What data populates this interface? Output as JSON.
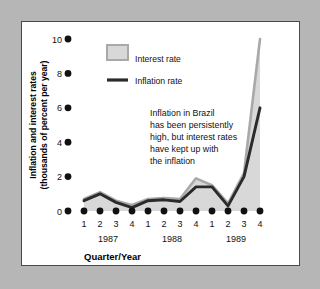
{
  "figure": {
    "background_color": "#b6b6b6",
    "panel_color": "#ffffff",
    "border_color": "#4a4a4a"
  },
  "chart_data": {
    "type": "area",
    "title": "",
    "subtitle": "",
    "xlabel": "Quarter/Year",
    "ylabel": "Inflation and interest rates (thousands of percent per year)",
    "ylabel_line1": "Inflation and interest rates",
    "ylabel_line2": "(thousands of percent per year)",
    "categories": [
      "1",
      "2",
      "3",
      "4",
      "1",
      "2",
      "3",
      "4",
      "1",
      "2",
      "3",
      "4"
    ],
    "x": [
      1,
      2,
      3,
      4,
      5,
      6,
      7,
      8,
      9,
      10,
      11,
      12
    ],
    "group_labels": [
      "1987",
      "1988",
      "1989"
    ],
    "ylim": [
      0,
      10
    ],
    "yticks": [
      0,
      2,
      4,
      6,
      8,
      10
    ],
    "ytick_labels": [
      "0",
      "2",
      "4",
      "6",
      "8",
      "10"
    ],
    "grid": false,
    "legend_position": "upper-left",
    "series": [
      {
        "name": "Interest rate",
        "style": "area",
        "color": "#d0d0d0",
        "edge_color": "#9a9a9a",
        "values": [
          0.7,
          1.1,
          0.6,
          0.35,
          0.7,
          0.75,
          0.7,
          1.9,
          1.5,
          0.45,
          2.2,
          10.0
        ]
      },
      {
        "name": "Inflation rate",
        "style": "line",
        "color": "#2b2b2b",
        "values": [
          0.6,
          1.0,
          0.5,
          0.2,
          0.6,
          0.65,
          0.55,
          1.4,
          1.4,
          0.3,
          2.0,
          6.0
        ]
      }
    ],
    "annotations": [
      {
        "id": "brazil-note",
        "lines": [
          "Inflation in Brazil",
          "has been persistently",
          "high, but interest rates",
          "have kept up with",
          "the inflation"
        ]
      }
    ]
  },
  "legend": {
    "items": [
      {
        "label": "Interest rate",
        "marker": "swatch",
        "color": "#d0d0d0"
      },
      {
        "label": "Inflation rate",
        "marker": "line",
        "color": "#2b2b2b"
      }
    ]
  }
}
